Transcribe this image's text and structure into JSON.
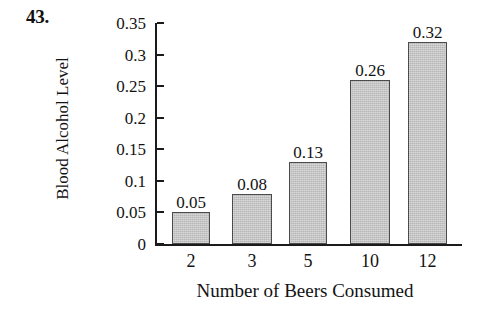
{
  "figure": {
    "problem_number": "43."
  },
  "chart_data": {
    "type": "bar",
    "title": "",
    "xlabel": "Number of Beers Consumed",
    "ylabel": "Blood Alcohol Level",
    "categories": [
      "2",
      "3",
      "5",
      "10",
      "12"
    ],
    "values": [
      0.05,
      0.08,
      0.13,
      0.26,
      0.32
    ],
    "value_labels": [
      "0.05",
      "0.08",
      "0.13",
      "0.26",
      "0.32"
    ],
    "ylim": [
      0,
      0.35
    ],
    "ytick_values": [
      0,
      0.05,
      0.1,
      0.15,
      0.2,
      0.25,
      0.3,
      0.35
    ],
    "ytick_labels": [
      "0",
      "0.05",
      "0.1",
      "0.15",
      "0.2",
      "0.25",
      "0.3",
      "0.35"
    ],
    "grid": false,
    "legend": false,
    "legend_position": "none",
    "bar_fill_color": "#b6b6b6",
    "bar_edge_color": "#4b4b4b",
    "background_color": "#ffffff",
    "text_color": "#131313"
  }
}
